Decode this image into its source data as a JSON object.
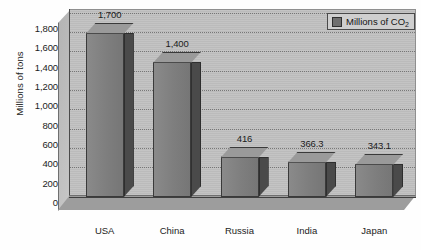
{
  "chart_data": {
    "type": "bar",
    "title": "",
    "subtitle": "",
    "xlabel": "",
    "ylabel": "Millions of tons",
    "categories": [
      "USA",
      "China",
      "Russia",
      "India",
      "Japan"
    ],
    "values": [
      1700,
      1400,
      416,
      366.3,
      343.1
    ],
    "point_labels": [
      "1,700",
      "1,400",
      "416",
      "366.3",
      "343.1"
    ],
    "series": [
      {
        "name": "Millions of CO2",
        "values": [
          1700,
          1400,
          416,
          366.3,
          343.1
        ]
      }
    ],
    "ylim": [
      0,
      1800
    ],
    "ytick_step": 200,
    "ytick_labels": [
      "0",
      "200",
      "400",
      "600",
      "800",
      "1,000",
      "1,200",
      "1,400",
      "1,600",
      "1,800"
    ],
    "ytick_values": [
      0,
      200,
      400,
      600,
      800,
      1000,
      1200,
      1400,
      1600,
      1800
    ],
    "grid": true,
    "grid_orientation": "horizontal",
    "legend_position": "top-right",
    "style": "3d-column-grayscale",
    "colors": {
      "bar_front": "#7e7e7e",
      "bar_side": "#4a4a4a",
      "bar_top": "#9a9a9a",
      "back_wall": "#c2c2c2",
      "floor": "#9d9d9d",
      "axis": "#3f3f3f",
      "text": "#1c1c1c",
      "legend_background": "#cfcfcf",
      "legend_swatch": "#6f6f6f"
    }
  },
  "legend": {
    "entries": [
      {
        "label_prefix": "Millions of CO",
        "label_sub": "2"
      }
    ]
  },
  "caption": {
    "cutoff_text": " "
  }
}
